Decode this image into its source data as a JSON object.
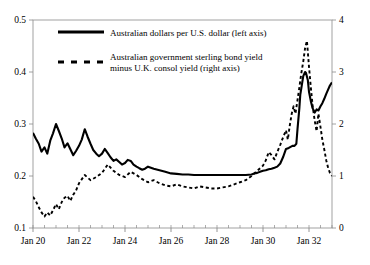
{
  "chart_data": {
    "type": "line",
    "title": "",
    "subtitle": "",
    "xlabel": "",
    "ylabel": "",
    "grid": false,
    "legend_position": "top-left-inside",
    "x_ticks": [
      "Jan 20",
      "Jan 22",
      "Jan 24",
      "Jan 26",
      "Jan 28",
      "Jan 30",
      "Jan 32"
    ],
    "x_tick_values": [
      1920.0,
      1922.0,
      1924.0,
      1926.0,
      1928.0,
      1930.0,
      1932.0
    ],
    "x_minor_step_years": 0.5,
    "xlim": [
      1920.0,
      1933.0
    ],
    "left_axis": {
      "label": "Australian dollars per U.S. dollar (left axis)",
      "ticks": [
        "0.1",
        "0.2",
        "0.3",
        "0.4",
        "0.5"
      ],
      "tick_values": [
        0.1,
        0.2,
        0.3,
        0.4,
        0.5
      ],
      "ylim": [
        0.1,
        0.5
      ]
    },
    "right_axis": {
      "label": "Australian government sterling bond yield minus U.K. consol yield (right axis)",
      "ticks": [
        "0",
        "1",
        "2",
        "3",
        "4"
      ],
      "tick_values": [
        0,
        1,
        2,
        3,
        4
      ],
      "ylim": [
        0,
        4
      ]
    },
    "series": [
      {
        "name": "Australian dollars per U.S. dollar (left axis)",
        "axis": "left",
        "style": "solid",
        "color": "#000000",
        "width": 2.1,
        "x": [
          1920.0,
          1920.12,
          1920.25,
          1920.37,
          1920.5,
          1920.62,
          1920.75,
          1920.87,
          1921.0,
          1921.12,
          1921.25,
          1921.37,
          1921.5,
          1921.62,
          1921.75,
          1921.87,
          1922.0,
          1922.12,
          1922.25,
          1922.37,
          1922.5,
          1922.62,
          1922.75,
          1922.87,
          1923.0,
          1923.12,
          1923.25,
          1923.37,
          1923.5,
          1923.62,
          1923.75,
          1923.87,
          1924.0,
          1924.12,
          1924.25,
          1924.37,
          1924.5,
          1924.62,
          1924.75,
          1924.87,
          1925.0,
          1925.25,
          1925.5,
          1925.75,
          1926.0,
          1926.25,
          1926.5,
          1926.75,
          1927.0,
          1927.25,
          1927.5,
          1927.75,
          1928.0,
          1928.25,
          1928.5,
          1928.75,
          1929.0,
          1929.25,
          1929.5,
          1929.62,
          1929.75,
          1929.87,
          1930.0,
          1930.12,
          1930.25,
          1930.37,
          1930.5,
          1930.62,
          1930.75,
          1930.87,
          1931.0,
          1931.12,
          1931.2,
          1931.28,
          1931.37,
          1931.45,
          1931.5,
          1931.58,
          1931.62,
          1931.7,
          1931.75,
          1931.83,
          1931.87,
          1931.95,
          1932.0,
          1932.08,
          1932.16,
          1932.25,
          1932.33,
          1932.41,
          1932.5,
          1932.58,
          1932.66,
          1932.75,
          1932.83,
          1932.91,
          1933.0
        ],
        "y": [
          0.283,
          0.272,
          0.262,
          0.247,
          0.255,
          0.243,
          0.268,
          0.282,
          0.3,
          0.287,
          0.272,
          0.255,
          0.263,
          0.252,
          0.24,
          0.248,
          0.258,
          0.27,
          0.29,
          0.276,
          0.262,
          0.25,
          0.243,
          0.238,
          0.243,
          0.252,
          0.244,
          0.236,
          0.229,
          0.232,
          0.227,
          0.222,
          0.225,
          0.231,
          0.229,
          0.222,
          0.218,
          0.215,
          0.212,
          0.214,
          0.218,
          0.214,
          0.211,
          0.208,
          0.205,
          0.204,
          0.203,
          0.203,
          0.202,
          0.202,
          0.202,
          0.202,
          0.202,
          0.202,
          0.202,
          0.202,
          0.202,
          0.202,
          0.203,
          0.205,
          0.206,
          0.208,
          0.21,
          0.211,
          0.213,
          0.214,
          0.216,
          0.218,
          0.224,
          0.236,
          0.252,
          0.254,
          0.256,
          0.258,
          0.258,
          0.262,
          0.29,
          0.33,
          0.356,
          0.378,
          0.392,
          0.4,
          0.398,
          0.384,
          0.362,
          0.344,
          0.33,
          0.322,
          0.328,
          0.326,
          0.334,
          0.34,
          0.348,
          0.358,
          0.366,
          0.374,
          0.38
        ]
      },
      {
        "name": "Australian government sterling bond yield minus U.K. consol yield (right axis)",
        "axis": "right",
        "style": "dashed",
        "color": "#000000",
        "width": 1.9,
        "x": [
          1920.0,
          1920.12,
          1920.25,
          1920.37,
          1920.5,
          1920.62,
          1920.75,
          1920.87,
          1921.0,
          1921.12,
          1921.25,
          1921.37,
          1921.5,
          1921.62,
          1921.75,
          1921.87,
          1922.0,
          1922.25,
          1922.5,
          1922.75,
          1923.0,
          1923.25,
          1923.5,
          1923.75,
          1924.0,
          1924.25,
          1924.5,
          1924.75,
          1925.0,
          1925.25,
          1925.5,
          1925.75,
          1926.0,
          1926.25,
          1926.5,
          1926.75,
          1927.0,
          1927.25,
          1927.5,
          1927.75,
          1928.0,
          1928.25,
          1928.5,
          1928.75,
          1929.0,
          1929.25,
          1929.5,
          1929.75,
          1930.0,
          1930.12,
          1930.25,
          1930.37,
          1930.5,
          1930.62,
          1930.75,
          1930.87,
          1931.0,
          1931.08,
          1931.16,
          1931.25,
          1931.33,
          1931.41,
          1931.5,
          1931.58,
          1931.66,
          1931.75,
          1931.83,
          1931.91,
          1932.0,
          1932.08,
          1932.16,
          1932.25,
          1932.33,
          1932.41,
          1932.5,
          1932.58,
          1932.66,
          1932.75,
          1932.83,
          1932.91,
          1933.0
        ],
        "y": [
          0.6,
          0.52,
          0.4,
          0.3,
          0.22,
          0.3,
          0.24,
          0.34,
          0.46,
          0.36,
          0.5,
          0.58,
          0.62,
          0.52,
          0.64,
          0.72,
          0.86,
          1.02,
          0.92,
          0.98,
          1.06,
          1.22,
          1.1,
          1.02,
          0.98,
          1.08,
          1.02,
          0.94,
          0.88,
          0.92,
          0.86,
          0.82,
          0.8,
          0.84,
          0.8,
          0.78,
          0.76,
          0.8,
          0.78,
          0.76,
          0.76,
          0.78,
          0.8,
          0.84,
          0.88,
          0.92,
          1.0,
          1.1,
          1.2,
          1.3,
          1.46,
          1.4,
          1.32,
          1.46,
          1.6,
          1.74,
          1.88,
          1.7,
          1.96,
          2.2,
          2.34,
          2.2,
          2.46,
          2.7,
          2.96,
          3.2,
          3.46,
          3.6,
          3.1,
          2.7,
          2.34,
          2.06,
          1.86,
          2.2,
          1.94,
          1.7,
          1.52,
          1.3,
          1.16,
          1.06,
          1.0
        ]
      }
    ]
  },
  "legend": {
    "entries": [
      {
        "label": "Australian dollars per U.S. dollar (left axis)",
        "style": "solid"
      },
      {
        "label_line1": "Australian government sterling bond yield",
        "label_line2": "minus U.K. consol yield (right axis)",
        "style": "dashed"
      }
    ]
  }
}
